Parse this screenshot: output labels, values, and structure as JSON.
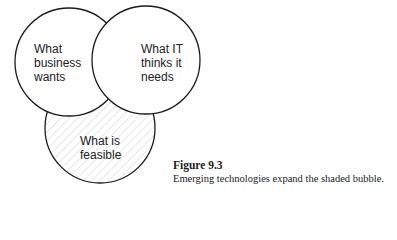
{
  "diagram": {
    "type": "venn",
    "circles": [
      {
        "id": "business",
        "label": "What\nbusiness\nwants",
        "shaded": false
      },
      {
        "id": "it",
        "label": "What IT\nthinks it\nneeds",
        "shaded": false
      },
      {
        "id": "feasible",
        "label": "What is\nfeasible",
        "shaded": true
      }
    ],
    "stroke_color": "#1a1a1a",
    "hatch_color": "#cfcfcf"
  },
  "caption": {
    "figure": "Figure 9.3",
    "text": "Emerging technologies expand the shaded bubble."
  }
}
